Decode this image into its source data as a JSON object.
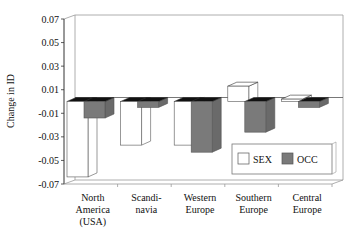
{
  "chart_data": {
    "type": "bar",
    "style": "3d-clustered",
    "title": "",
    "xlabel": "",
    "ylabel": "Change in ID",
    "ylim": [
      -0.07,
      0.07
    ],
    "yticks": [
      "0.07",
      "0.05",
      "0.03",
      "0.01",
      "-0.01",
      "-0.03",
      "-0.05",
      "-0.07"
    ],
    "grid": false,
    "legend_position": "lower-right inside",
    "categories": [
      [
        "North",
        "America",
        "(USA)"
      ],
      [
        "Scandi-",
        "navia"
      ],
      [
        "Western",
        "Europe"
      ],
      [
        "Southern",
        "Europe"
      ],
      [
        "Central",
        "Europe"
      ]
    ],
    "series": [
      {
        "name": "SEX",
        "color": "#ffffff",
        "values": [
          -0.064,
          -0.037,
          -0.037,
          0.013,
          0.002
        ]
      },
      {
        "name": "OCC",
        "color": "#7a7a7a",
        "values": [
          -0.014,
          -0.005,
          -0.043,
          -0.026,
          -0.005
        ]
      }
    ]
  },
  "legend": {
    "items": [
      {
        "label": "SEX"
      },
      {
        "label": "OCC"
      }
    ]
  },
  "axis": {
    "ylabel": "Change in ID"
  }
}
